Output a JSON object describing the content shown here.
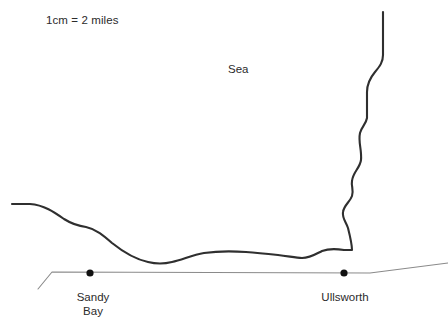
{
  "map": {
    "title": "coastline-map",
    "background_color": "#ffffff",
    "coastline_color": "#2f2f2f",
    "road_color": "#8a8a8a",
    "marker_color": "#111111",
    "text_color": "#2b2b2b",
    "scale": {
      "text": "1cm = 2 miles"
    },
    "sea": {
      "label": "Sea"
    },
    "places": [
      {
        "name": "Sandy Bay",
        "label_line1": "Sandy",
        "label_line2": "Bay",
        "marker_x": 90,
        "marker_y": 273
      },
      {
        "name": "Ullsworth",
        "label_line1": "Ullsworth",
        "label_line2": "",
        "marker_x": 344,
        "marker_y": 273
      }
    ],
    "features": {
      "coastline_name": "coastline",
      "road_name": "road"
    }
  }
}
